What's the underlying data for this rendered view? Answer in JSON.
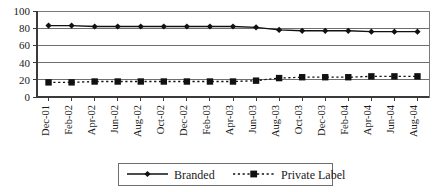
{
  "chart_data": {
    "type": "line",
    "title": "",
    "subtitle": "",
    "xlabel": "",
    "ylabel": "",
    "ylim": [
      0,
      100
    ],
    "yticks": [
      0,
      20,
      40,
      60,
      80,
      100
    ],
    "grid": true,
    "legend_position": "bottom",
    "categories": [
      "Dec-01",
      "Feb-02",
      "Apr-02",
      "Jun-02",
      "Aug-02",
      "Oct-02",
      "Dec-02",
      "Feb-03",
      "Apr-03",
      "Jun-03",
      "Aug-03",
      "Oct-03",
      "Dec-03",
      "Feb-04",
      "Apr-04",
      "Jun-04",
      "Aug-04"
    ],
    "series": [
      {
        "name": "Branded",
        "marker": "diamond",
        "linestyle": "solid",
        "color": "#111111",
        "values": [
          83,
          83,
          82,
          82,
          82,
          82,
          82,
          82,
          82,
          81,
          78,
          77,
          77,
          77,
          76,
          76,
          76
        ]
      },
      {
        "name": "Private Label",
        "marker": "square",
        "linestyle": "dotted",
        "color": "#111111",
        "values": [
          17,
          17,
          18,
          18,
          18,
          18,
          18,
          18,
          18,
          19,
          22,
          23,
          23,
          23,
          24,
          24,
          24
        ]
      }
    ]
  },
  "legend": {
    "entries": [
      {
        "label": "Branded"
      },
      {
        "label": "Private Label"
      }
    ]
  },
  "axes": {
    "y_tick_labels": [
      "0",
      "20",
      "40",
      "60",
      "80",
      "100"
    ],
    "x_tick_labels": [
      "Dec-01",
      "Feb-02",
      "Apr-02",
      "Jun-02",
      "Aug-02",
      "Oct-02",
      "Dec-02",
      "Feb-03",
      "Apr-03",
      "Jun-03",
      "Aug-03",
      "Oct-03",
      "Dec-03",
      "Feb-04",
      "Apr-04",
      "Jun-04",
      "Aug-04"
    ]
  },
  "colors": {
    "series": "#111111",
    "grid": "#6e6e6e",
    "axis": "#3a3a3a",
    "background": "#ffffff"
  }
}
